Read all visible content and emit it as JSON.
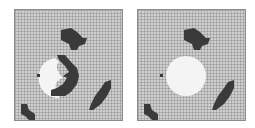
{
  "colors": {
    "background": "#cfcfcf",
    "obstacle": "#3a3a3a",
    "free_region": "#f4f4f4",
    "agent": "#3a3a3a",
    "grid_line": "#9a9a9a"
  },
  "panels": [
    {
      "id": "left",
      "description": "grid map with crescent-shaped obstacle partially occluding lit region",
      "grid_cells": 36
    },
    {
      "id": "right",
      "description": "grid map with full circular lit region, crescent obstacle removed",
      "grid_cells": 36
    }
  ]
}
